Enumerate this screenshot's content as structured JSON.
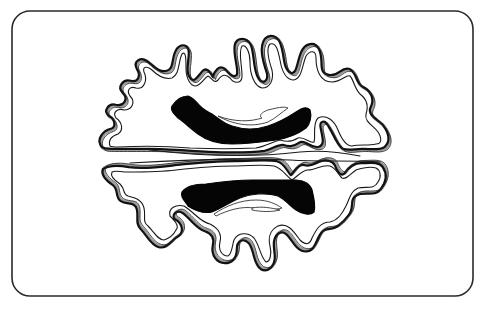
{
  "figure": {
    "frame": {
      "x": 12,
      "y": 11,
      "width": 461,
      "height": 285,
      "radius": 18,
      "stroke": "#2a2a2a"
    },
    "colors": {
      "background": "#ffffff",
      "outline": "#111111",
      "stipple": "#9a9a9a",
      "lesion": "#050505"
    },
    "regions": [
      {
        "name": "upper-hemisphere",
        "lesion": "upper-periventricular-lesion"
      },
      {
        "name": "lower-hemisphere",
        "lesion": "lower-periventricular-lesion"
      }
    ]
  }
}
